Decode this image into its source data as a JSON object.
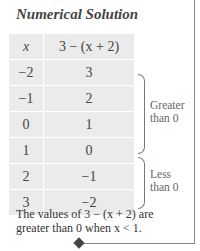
{
  "title": "Numerical Solution",
  "table": {
    "headers": [
      "x",
      "3 − (x + 2)"
    ],
    "rows": [
      [
        "−2",
        "3"
      ],
      [
        "−1",
        "2"
      ],
      [
        "0",
        "1"
      ],
      [
        "1",
        "0"
      ],
      [
        "2",
        "−1"
      ],
      [
        "3",
        "−2"
      ]
    ]
  },
  "annotations": {
    "greater": "Greater than 0",
    "less": "Less than 0"
  },
  "caption": "The values of 3 − (x + 2) are greater than 0 when x < 1."
}
